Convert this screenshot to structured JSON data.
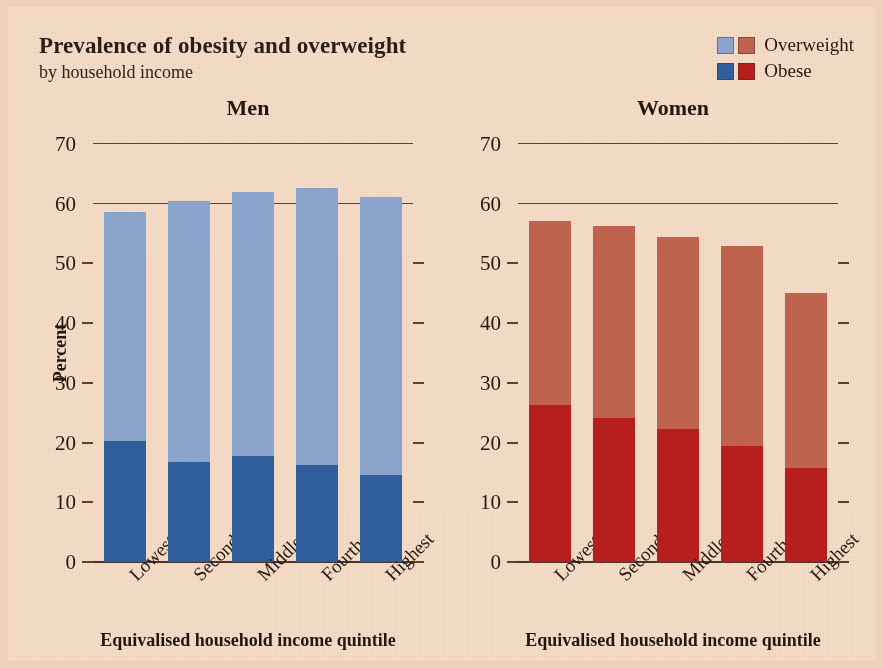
{
  "title": "Prevalence of obesity and overweight",
  "subtitle": "by household income",
  "legend": {
    "items": [
      {
        "label": "Overweight",
        "color_men": "#8ba6cf",
        "color_women": "#c0644f"
      },
      {
        "label": "Obese",
        "color_men": "#2f5f9e",
        "color_women": "#b81f1c"
      }
    ]
  },
  "colors": {
    "background": "#f4dcc7",
    "men_overweight": "#8ba6cf",
    "men_obese": "#2f5f9e",
    "women_overweight": "#c0644f",
    "women_obese": "#b81f1c",
    "axis": "#4a352a",
    "text": "#241810"
  },
  "axes": {
    "ylabel": "Percent",
    "xlabel": "Equivalised household income quintile",
    "yticks": [
      0,
      10,
      20,
      30,
      40,
      50,
      60,
      70
    ],
    "ylim": [
      0,
      70
    ]
  },
  "panels": [
    {
      "title": "Men"
    },
    {
      "title": "Women"
    }
  ],
  "chart_data": {
    "type": "bar",
    "title": "Prevalence of obesity and overweight",
    "subtitle": "by household income",
    "stacked": true,
    "xlabel": "Equivalised household income quintile",
    "ylabel": "Percent",
    "ylim": [
      0,
      70
    ],
    "yticks": [
      0,
      10,
      20,
      30,
      40,
      50,
      60,
      70
    ],
    "grid": "horizontal lines at 60 and 70; short ticks elsewhere",
    "legend_position": "top-right",
    "categories": [
      "Lowest",
      "Second",
      "Middle",
      "Fourth",
      "Highest"
    ],
    "panels": [
      {
        "name": "Men",
        "series": [
          {
            "name": "Obese",
            "color": "#2f5f9e",
            "values": [
              20.3,
              16.8,
              17.8,
              16.3,
              14.5
            ]
          },
          {
            "name": "Overweight",
            "color": "#8ba6cf",
            "values": [
              38.3,
              43.7,
              44.2,
              46.4,
              46.6
            ]
          }
        ],
        "totals": [
          58.6,
          60.5,
          62.0,
          62.7,
          61.1
        ]
      },
      {
        "name": "Women",
        "series": [
          {
            "name": "Obese",
            "color": "#b81f1c",
            "values": [
              26.3,
              24.1,
              22.3,
              19.4,
              15.7
            ]
          },
          {
            "name": "Overweight",
            "color": "#c0644f",
            "values": [
              30.8,
              32.1,
              32.2,
              33.5,
              29.3
            ]
          }
        ],
        "totals": [
          57.1,
          56.2,
          54.5,
          52.9,
          45.0
        ]
      }
    ]
  }
}
